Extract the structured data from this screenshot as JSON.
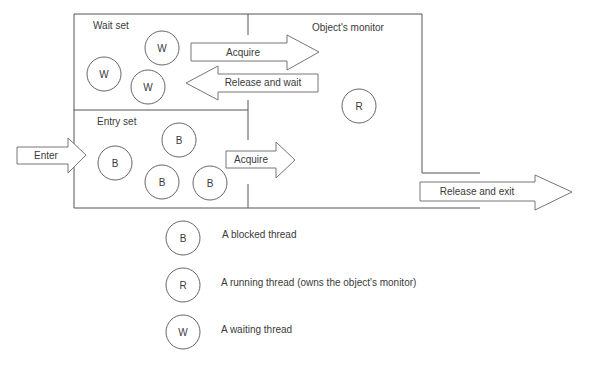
{
  "diagram": {
    "regions": {
      "wait_set": "Wait set",
      "entry_set": "Entry set",
      "monitor": "Object's monitor"
    },
    "arrows": {
      "enter": "Enter",
      "acquire_from_wait": "Acquire",
      "release_and_wait": "Release and wait",
      "acquire_from_entry": "Acquire",
      "release_and_exit": "Release and exit"
    },
    "threads": {
      "wait_set": [
        "W",
        "W",
        "W"
      ],
      "entry_set": [
        "B",
        "B",
        "B",
        "B"
      ],
      "monitor": [
        "R"
      ]
    },
    "legend": [
      {
        "symbol": "B",
        "label": "A blocked thread"
      },
      {
        "symbol": "R",
        "label": "A running thread (owns the object's monitor)"
      },
      {
        "symbol": "W",
        "label": "A waiting thread"
      }
    ]
  }
}
